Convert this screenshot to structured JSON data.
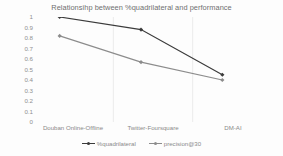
{
  "chart_data": {
    "type": "line",
    "title": "Relationsihp between %quadrilateral and performance",
    "xlabel": "",
    "ylabel": "",
    "categories": [
      "Douban Online-Offline",
      "Twitter-Foursquare",
      "DM-AI"
    ],
    "ylim": [
      0,
      1
    ],
    "yticks": [
      "1",
      "0.9",
      "0.8",
      "0.7",
      "0.6",
      "0.5",
      "0.4",
      "0.3",
      "0.2",
      "0.1",
      "0"
    ],
    "ytick_values": [
      1,
      0.9,
      0.8,
      0.7,
      0.6,
      0.5,
      0.4,
      0.3,
      0.2,
      0.1,
      0
    ],
    "grid": true,
    "legend_position": "bottom",
    "series": [
      {
        "name": "%quadrilateral",
        "values": [
          1.0,
          0.88,
          0.45
        ],
        "color": "#3b3b3b",
        "marker": "diamond"
      },
      {
        "name": "precision@30",
        "values": [
          0.82,
          0.57,
          0.4
        ],
        "color": "#8c8c8c",
        "marker": "diamond"
      }
    ]
  },
  "axis": {
    "y_tick_0": "1",
    "y_tick_1": "0.9",
    "y_tick_2": "0.8",
    "y_tick_3": "0.7",
    "y_tick_4": "0.6",
    "y_tick_5": "0.5",
    "y_tick_6": "0.4",
    "y_tick_7": "0.3",
    "y_tick_8": "0.2",
    "y_tick_9": "0.1",
    "y_tick_10": "0"
  },
  "colors": {
    "series_1": "#3b3b3b",
    "series_2": "#8c8c8c",
    "gridline": "#e4e4e4",
    "text": "#8a8a8a",
    "background": "#fdfdfd"
  }
}
